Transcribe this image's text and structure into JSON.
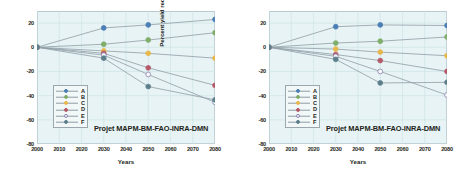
{
  "chart_data": [
    {
      "type": "line",
      "title": "",
      "panel_id": "A2",
      "ylabel": "Percent yield reduction (A2)",
      "xlabel": "Years",
      "annotation": "Projet  MAPM-BM-FAO-INRA-DMN",
      "x": [
        2000,
        2030,
        2050,
        2080
      ],
      "xlim": [
        2000,
        2080
      ],
      "ylim": [
        -80,
        30
      ],
      "xticks": [
        2000,
        2010,
        2020,
        2030,
        2040,
        2050,
        2060,
        2070,
        2080
      ],
      "yticks": [
        20,
        0,
        -20,
        -40,
        -60,
        -80
      ],
      "grid": true,
      "legend_position": "lower-left",
      "series": [
        {
          "name": "A",
          "color": "#4a7eb5",
          "filled": true,
          "values": [
            0,
            16,
            18.5,
            23
          ]
        },
        {
          "name": "B",
          "color": "#7fae6a",
          "filled": true,
          "values": [
            0,
            2.5,
            6,
            12
          ]
        },
        {
          "name": "C",
          "color": "#e8b84b",
          "filled": true,
          "values": [
            0,
            -3,
            -5,
            -9
          ]
        },
        {
          "name": "D",
          "color": "#b5596a",
          "filled": true,
          "values": [
            0,
            -5,
            -17,
            -31.5
          ]
        },
        {
          "name": "E",
          "color": "#8f7fae",
          "filled": false,
          "values": [
            0,
            -6.5,
            -22.5,
            -45.5
          ]
        },
        {
          "name": "F",
          "color": "#5d7f8c",
          "filled": true,
          "values": [
            0,
            -9,
            -32.5,
            -43.5
          ]
        }
      ]
    },
    {
      "type": "line",
      "title": "",
      "panel_id": "B2",
      "ylabel": "Percent yield reduction (B2)",
      "xlabel": "Years",
      "annotation": "Projet  MAPM-BM-FAO-INRA-DMN",
      "x": [
        2000,
        2030,
        2050,
        2080
      ],
      "xlim": [
        2000,
        2080
      ],
      "ylim": [
        -80,
        30
      ],
      "xticks": [
        2000,
        2010,
        2020,
        2030,
        2040,
        2050,
        2060,
        2070,
        2080
      ],
      "yticks": [
        20,
        0,
        -20,
        -40,
        -60,
        -80
      ],
      "grid": true,
      "legend_position": "lower-left",
      "series": [
        {
          "name": "A",
          "color": "#4a7eb5",
          "filled": true,
          "values": [
            0,
            17,
            18.5,
            18
          ]
        },
        {
          "name": "B",
          "color": "#7fae6a",
          "filled": true,
          "values": [
            0,
            3.5,
            5,
            8.5
          ]
        },
        {
          "name": "C",
          "color": "#e8b84b",
          "filled": true,
          "values": [
            0,
            -1.5,
            -4,
            -7
          ]
        },
        {
          "name": "D",
          "color": "#b5596a",
          "filled": true,
          "values": [
            0,
            -6,
            -11,
            -20
          ]
        },
        {
          "name": "E",
          "color": "#8f7fae",
          "filled": false,
          "values": [
            0,
            -7.5,
            -20,
            -39.5
          ]
        },
        {
          "name": "F",
          "color": "#5d7f8c",
          "filled": true,
          "values": [
            0,
            -10,
            -29.5,
            -29
          ]
        }
      ]
    }
  ],
  "panels": [
    {
      "ylabel": "Percent yield reduction (A2)",
      "xlabel": "Years",
      "annotation": "Projet  MAPM-BM-FAO-INRA-DMN",
      "yticks": [
        "20",
        "0",
        "-20",
        "-40",
        "-60",
        "-80"
      ],
      "xticks": [
        "2000",
        "2010",
        "2020",
        "2030",
        "2040",
        "2050",
        "2060",
        "2070",
        "2080"
      ],
      "legend": [
        {
          "label": "A"
        },
        {
          "label": "B"
        },
        {
          "label": "C"
        },
        {
          "label": "D"
        },
        {
          "label": "E"
        },
        {
          "label": "F"
        }
      ]
    },
    {
      "ylabel": "Percent yield reduction (B2)",
      "xlabel": "Years",
      "annotation": "Projet  MAPM-BM-FAO-INRA-DMN",
      "yticks": [
        "20",
        "0",
        "-20",
        "-40",
        "-60",
        "-80"
      ],
      "xticks": [
        "2000",
        "2010",
        "2020",
        "2030",
        "2040",
        "2050",
        "2060",
        "2070",
        "2080"
      ],
      "legend": [
        {
          "label": "A"
        },
        {
          "label": "B"
        },
        {
          "label": "C"
        },
        {
          "label": "D"
        },
        {
          "label": "E"
        },
        {
          "label": "F"
        }
      ]
    }
  ],
  "colors": {
    "plot_background": "#e7f3f4",
    "grid": "#cfe4e6",
    "axis": "#b9c9d2",
    "text": "#231f20",
    "series_a": "#4a7eb5",
    "series_b": "#7fae6a",
    "series_c": "#e8b84b",
    "series_d": "#b5596a",
    "series_e": "#8f7fae",
    "series_f": "#5d7f8c"
  }
}
